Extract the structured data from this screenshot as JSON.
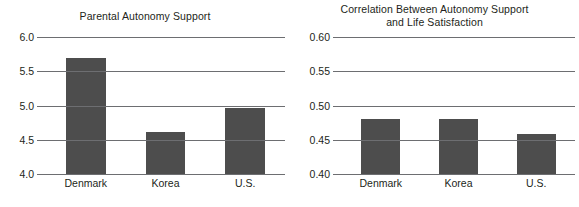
{
  "figure": {
    "background": "#ffffff",
    "bar_color": "#4d4d4d",
    "axis_color": "#6d6e71",
    "text_color": "#231f20"
  },
  "panels": [
    {
      "title": "Parental Autonomy Support",
      "ticks": [
        "6.0",
        "5.5",
        "5.0",
        "4.5",
        "4.0"
      ],
      "categories": [
        "Denmark",
        "Korea",
        "U.S."
      ]
    },
    {
      "title": "Correlation Between Autonomy Support\nand Life Satisfaction",
      "ticks": [
        "0.60",
        "0.55",
        "0.50",
        "0.45",
        "0.40"
      ],
      "categories": [
        "Denmark",
        "Korea",
        "U.S."
      ]
    }
  ],
  "chart_data": [
    {
      "type": "bar",
      "title": "Parental Autonomy Support",
      "xlabel": "",
      "ylabel": "",
      "categories": [
        "Denmark",
        "Korea",
        "U.S."
      ],
      "values": [
        5.7,
        4.62,
        4.96
      ],
      "ylim": [
        4.0,
        6.0
      ],
      "yticks": [
        4.0,
        4.5,
        5.0,
        5.5,
        6.0
      ],
      "ytick_labels": [
        "4.0",
        "4.5",
        "5.0",
        "5.5",
        "6.0"
      ],
      "grid": true,
      "legend": false,
      "bar_color": "#4d4d4d"
    },
    {
      "type": "bar",
      "title": "Correlation Between Autonomy Support and Life Satisfaction",
      "xlabel": "",
      "ylabel": "",
      "categories": [
        "Denmark",
        "Korea",
        "U.S."
      ],
      "values": [
        0.48,
        0.48,
        0.458
      ],
      "ylim": [
        0.4,
        0.6
      ],
      "yticks": [
        0.4,
        0.45,
        0.5,
        0.55,
        0.6
      ],
      "ytick_labels": [
        "0.40",
        "0.45",
        "0.50",
        "0.55",
        "0.60"
      ],
      "grid": true,
      "legend": false,
      "bar_color": "#4d4d4d"
    }
  ]
}
